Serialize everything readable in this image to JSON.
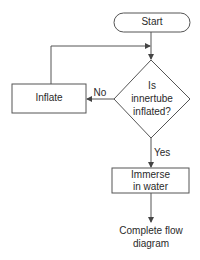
{
  "diagram": {
    "type": "flowchart",
    "nodes": {
      "start": {
        "shape": "terminator",
        "label": "Start"
      },
      "decision": {
        "shape": "diamond",
        "line1": "Is",
        "line2": "innertube",
        "line3": "inflated?"
      },
      "inflate": {
        "shape": "process",
        "label": "Inflate"
      },
      "immerse": {
        "shape": "process",
        "line1": "Immerse",
        "line2": "in water"
      },
      "end": {
        "shape": "text",
        "line1": "Complete flow",
        "line2": "diagram"
      }
    },
    "edges": {
      "no_label": "No",
      "yes_label": "Yes"
    },
    "colors": {
      "stroke": "#555555",
      "text": "#2a2a2a",
      "background": "#ffffff"
    }
  }
}
